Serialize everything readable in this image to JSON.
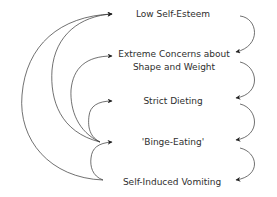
{
  "diagram": {
    "type": "flow-cycle",
    "nodes": [
      {
        "id": "low-self-esteem",
        "label": "Low Self-Esteem"
      },
      {
        "id": "extreme-concerns",
        "label_line1": "Extreme Concerns about",
        "label_line2": "Shape and Weight"
      },
      {
        "id": "strict-dieting",
        "label": "Strict Dieting"
      },
      {
        "id": "binge-eating",
        "label": "'Binge-Eating'"
      },
      {
        "id": "self-induced-vomiting",
        "label": "Self-Induced Vomiting"
      }
    ],
    "edges_right": [
      {
        "from": "low-self-esteem",
        "to": "extreme-concerns"
      },
      {
        "from": "extreme-concerns",
        "to": "strict-dieting"
      },
      {
        "from": "strict-dieting",
        "to": "binge-eating"
      },
      {
        "from": "binge-eating",
        "to": "self-induced-vomiting"
      }
    ],
    "edges_left": [
      {
        "from": "binge-eating",
        "to": "low-self-esteem"
      },
      {
        "from": "binge-eating",
        "to": "extreme-concerns"
      },
      {
        "from": "binge-eating",
        "to": "strict-dieting"
      },
      {
        "from": "self-induced-vomiting",
        "to": "low-self-esteem"
      },
      {
        "from": "self-induced-vomiting",
        "to": "binge-eating"
      }
    ],
    "colors": {
      "line": "#222222",
      "text": "#2e2e2e",
      "background": "#ffffff"
    }
  }
}
